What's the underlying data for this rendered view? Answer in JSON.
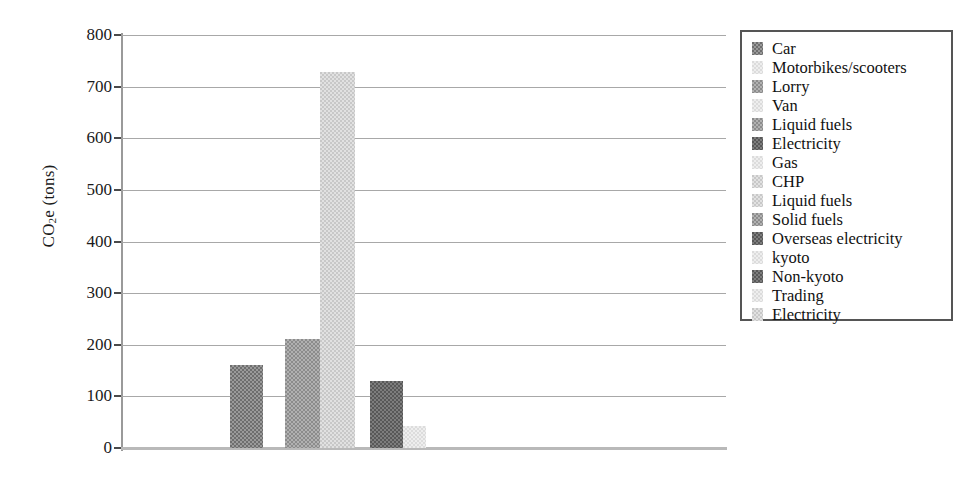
{
  "chart_data": {
    "type": "bar",
    "title": "",
    "xlabel": "",
    "ylabel": "CO2e (tons)",
    "ylabel_parts": {
      "pre": "CO",
      "sub": "2",
      "post": "e (tons)"
    },
    "ylim": [
      0,
      800
    ],
    "yticks": [
      0,
      100,
      200,
      300,
      400,
      500,
      600,
      700,
      800
    ],
    "ytick_labels": [
      "0",
      "100",
      "200",
      "300",
      "400",
      "500",
      "600",
      "700",
      "800"
    ],
    "grid": true,
    "grid_axis": "y",
    "legend_position": "right",
    "categories": [
      "Car",
      "Motorbikes/scooters",
      "Lorry",
      "Van",
      "Liquid fuels",
      "Electricity",
      "Gas",
      "CHP",
      "Liquid fuels",
      "Solid fuels",
      "Overseas electricity",
      "kyoto",
      "Non-kyoto",
      "Trading",
      "Electricity"
    ],
    "values": [
      160,
      0,
      212,
      0,
      0,
      728,
      0,
      42,
      0,
      0,
      0,
      0,
      0,
      0,
      0
    ],
    "visible_bars": [
      {
        "label": "Car",
        "value": 160,
        "shade": "pat-dark"
      },
      {
        "label": "Lorry",
        "value": 212,
        "shade": "pat-mid"
      },
      {
        "label": "CHP",
        "value": 728,
        "shade": "pat-light"
      },
      {
        "label": "Electricity",
        "value": 130,
        "shade": "pat-darkest"
      },
      {
        "label": "Trading",
        "value": 42,
        "shade": "pat-xlight"
      }
    ],
    "colors": {
      "bar_dark": "#6e6e6e",
      "bar_mid": "#8c8c8c",
      "bar_light": "#c8c8c8",
      "bar_xlight": "#dcdcdc",
      "bar_darkest": "#585858",
      "gridline": "#a8a8a8",
      "axis": "#9a9a9a",
      "legend_border": "#555555",
      "text": "#111111",
      "background": "#ffffff"
    }
  },
  "legend": {
    "items": [
      {
        "label": "Car",
        "shade": "pat-dark"
      },
      {
        "label": "Motorbikes/scooters",
        "shade": "pat-xlight"
      },
      {
        "label": "Lorry",
        "shade": "pat-mid"
      },
      {
        "label": "Van",
        "shade": "pat-xlight"
      },
      {
        "label": "Liquid fuels",
        "shade": "pat-mid"
      },
      {
        "label": "Electricity",
        "shade": "pat-darkest"
      },
      {
        "label": "Gas",
        "shade": "pat-xlight"
      },
      {
        "label": "CHP",
        "shade": "pat-light"
      },
      {
        "label": "Liquid fuels",
        "shade": "pat-light"
      },
      {
        "label": "Solid fuels",
        "shade": "pat-mid"
      },
      {
        "label": "Overseas electricity",
        "shade": "pat-darkest"
      },
      {
        "label": "kyoto",
        "shade": "pat-xlight"
      },
      {
        "label": "Non-kyoto",
        "shade": "pat-darkest"
      },
      {
        "label": "Trading",
        "shade": "pat-xlight"
      },
      {
        "label": "Electricity",
        "shade": "pat-light"
      }
    ]
  }
}
